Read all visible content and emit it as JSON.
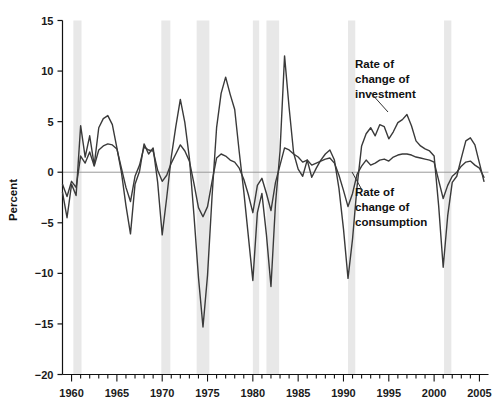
{
  "chart_data": {
    "type": "line",
    "title": "",
    "subtitle": "",
    "xlabel": "",
    "ylabel": "Percent",
    "xlim": [
      1959,
      2006
    ],
    "ylim": [
      -20,
      15
    ],
    "grid": false,
    "zero_line": true,
    "legend_position": "inline-annotations",
    "y_ticks": [
      15,
      10,
      5,
      0,
      -5,
      -10,
      -15,
      -20
    ],
    "y_tick_labels": [
      "15",
      "10",
      "5",
      "0",
      "−5",
      "−10",
      "−15",
      "−20"
    ],
    "x_ticks": [
      1960,
      1965,
      1970,
      1975,
      1980,
      1985,
      1990,
      1995,
      2000,
      2005
    ],
    "x_tick_labels": [
      "1960",
      "1965",
      "1970",
      "1975",
      "1980",
      "1985",
      "1990",
      "1995",
      "2000",
      "2005"
    ],
    "x_minor_tick_interval": 1,
    "x": [
      1959.0,
      1959.5,
      1960.0,
      1960.5,
      1961.0,
      1961.5,
      1962.0,
      1962.5,
      1963.0,
      1963.5,
      1964.0,
      1964.5,
      1965.0,
      1965.5,
      1966.0,
      1966.5,
      1967.0,
      1967.5,
      1968.0,
      1968.5,
      1969.0,
      1969.5,
      1970.0,
      1970.5,
      1971.0,
      1971.5,
      1972.0,
      1972.5,
      1973.0,
      1973.5,
      1974.0,
      1974.5,
      1975.0,
      1975.5,
      1976.0,
      1976.5,
      1977.0,
      1977.5,
      1978.0,
      1978.5,
      1979.0,
      1979.5,
      1980.0,
      1980.5,
      1981.0,
      1981.5,
      1982.0,
      1982.5,
      1983.0,
      1983.5,
      1984.0,
      1984.5,
      1985.0,
      1985.5,
      1986.0,
      1986.5,
      1987.0,
      1987.5,
      1988.0,
      1988.5,
      1989.0,
      1989.5,
      1990.0,
      1990.5,
      1991.0,
      1991.5,
      1992.0,
      1992.5,
      1993.0,
      1993.5,
      1994.0,
      1994.5,
      1995.0,
      1995.5,
      1996.0,
      1996.5,
      1997.0,
      1997.5,
      1998.0,
      1998.5,
      1999.0,
      1999.5,
      2000.0,
      2000.5,
      2001.0,
      2001.5,
      2002.0,
      2002.5,
      2003.0,
      2003.5,
      2004.0,
      2004.5,
      2005.0,
      2005.5
    ],
    "series": [
      {
        "name": "Rate of change of investment",
        "color": "#3a3a3a",
        "width": 1.4,
        "values": [
          -2.0,
          -4.5,
          -1.2,
          -2.3,
          4.6,
          1.5,
          3.6,
          0.7,
          4.4,
          5.3,
          5.6,
          4.7,
          2.4,
          0.0,
          -3.3,
          -6.1,
          -1.2,
          0.1,
          2.8,
          1.8,
          2.4,
          -1.0,
          -6.2,
          -2.5,
          1.5,
          4.5,
          7.2,
          4.9,
          1.4,
          -4.2,
          -10.4,
          -15.3,
          -10.2,
          -2.4,
          4.4,
          7.8,
          9.4,
          7.7,
          6.2,
          2.0,
          -1.9,
          -6.3,
          -10.7,
          -4.0,
          -2.1,
          -6.2,
          -11.3,
          -3.1,
          2.1,
          11.5,
          6.4,
          1.9,
          0.3,
          -0.4,
          1.2,
          -0.5,
          0.4,
          1.2,
          1.8,
          2.2,
          1.2,
          -1.6,
          -5.6,
          -10.5,
          -6.6,
          -1.4,
          2.6,
          3.8,
          4.4,
          3.6,
          4.7,
          4.5,
          3.3,
          4.0,
          4.9,
          5.2,
          5.7,
          4.6,
          3.1,
          2.6,
          2.3,
          2.1,
          1.6,
          -3.3,
          -9.4,
          -4.3,
          -1.0,
          -0.4,
          1.4,
          3.1,
          3.4,
          2.7,
          0.9,
          -0.9
        ]
      },
      {
        "name": "Rate of change of consumption",
        "color": "#3a3a3a",
        "width": 1.4,
        "values": [
          -1.2,
          -2.4,
          -0.9,
          -1.5,
          1.6,
          0.9,
          2.0,
          0.6,
          2.2,
          2.6,
          2.8,
          2.7,
          2.3,
          0.4,
          -1.5,
          -2.9,
          -0.4,
          0.7,
          2.5,
          2.2,
          2.1,
          0.2,
          -0.9,
          -0.3,
          0.9,
          1.8,
          2.7,
          2.1,
          1.1,
          -1.1,
          -3.5,
          -4.4,
          -3.4,
          -0.9,
          1.4,
          1.8,
          1.6,
          1.2,
          1.0,
          0.4,
          -0.7,
          -2.2,
          -4.0,
          -1.3,
          -0.6,
          -2.1,
          -3.8,
          -1.0,
          0.7,
          2.4,
          2.2,
          1.8,
          1.5,
          1.0,
          1.2,
          0.7,
          0.9,
          1.1,
          1.3,
          1.4,
          0.9,
          -0.3,
          -1.8,
          -3.4,
          -2.1,
          -0.2,
          0.6,
          1.2,
          0.7,
          0.9,
          1.2,
          1.3,
          1.1,
          1.5,
          1.7,
          1.8,
          1.8,
          1.7,
          1.5,
          1.4,
          1.3,
          1.2,
          1.0,
          -0.8,
          -2.6,
          -1.3,
          -0.4,
          0.0,
          0.6,
          1.0,
          1.1,
          0.7,
          0.4,
          -0.5
        ]
      }
    ],
    "shaded_bands": {
      "label": "recession-band",
      "color": "#e8e8e8",
      "ranges": [
        [
          1960.2,
          1961.1
        ],
        [
          1969.9,
          1970.9
        ],
        [
          1973.8,
          1975.2
        ],
        [
          1980.0,
          1980.7
        ],
        [
          1981.5,
          1982.9
        ],
        [
          1990.5,
          1991.3
        ],
        [
          2001.1,
          2001.9
        ]
      ]
    },
    "annotations": [
      {
        "name": "investment-annotation",
        "text_lines": [
          "Rate of",
          "change of",
          "investment"
        ],
        "x_px": 355,
        "y_px": 68,
        "leader": {
          "x1": 370,
          "y1": 92,
          "x2": 388,
          "y2": 112
        }
      },
      {
        "name": "consumption-annotation",
        "text_lines": [
          "Rate of",
          "change of",
          "consumption"
        ],
        "x_px": 355,
        "y_px": 196,
        "leader": {
          "x1": 362,
          "y1": 190,
          "x2": 352,
          "y2": 172
        }
      }
    ]
  },
  "axis": {
    "ylabel": "Percent",
    "axis_color": "#111111",
    "zero_line_color": "#9a9a9a"
  }
}
